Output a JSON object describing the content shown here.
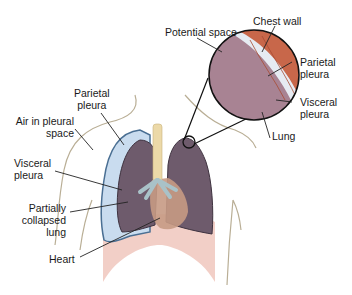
{
  "figure": {
    "labels": {
      "potential_space": "Potential space",
      "chest_wall": "Chest wall",
      "parietal_pleura_inset": "Parietal\npleura",
      "visceral_pleura_inset": "Visceral\npleura",
      "lung": "Lung",
      "parietal_pleura": "Parietal\npleura",
      "air_in_pleural_space": "Air in pleural\nspace",
      "visceral_pleura": "Visceral\npleura",
      "partially_collapsed_lung": "Partially\ncollapsed\nlung",
      "heart": "Heart"
    },
    "colors": {
      "lung": "#6e5b6c",
      "air_space": "#c9dcef",
      "pleura_outline": "#4a6f93",
      "chest_wall_muscle": "#c8674a",
      "inset_lung": "#a88393",
      "pleural_space_inset": "#e6ebf2",
      "heart": "#c79a84",
      "diaphragm": "#f0c7bd",
      "trachea": "#ecd9a8",
      "bronchi": "#a9c2c8"
    }
  }
}
